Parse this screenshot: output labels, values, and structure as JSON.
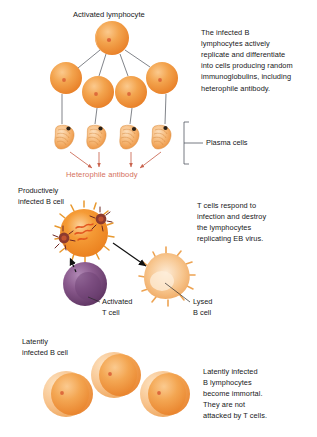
{
  "figure": {
    "background_color": "#ffffff",
    "text_color": "#17181a",
    "accent_color": "#d4705c",
    "cell_color": "#ef8b33",
    "cell_pale_color": "#f6d2a8",
    "tcell_color": "#7b4a7e",
    "virus_color": "#7a2f2a"
  },
  "labels": {
    "activated_lymphocyte": "Activated lymphocyte",
    "plasma_cells": "Plasma cells",
    "heterophile_antibody": "Heterophile antibody",
    "productively_infected_b_cell": "Productively\ninfected B cell",
    "activated_t_cell": "Activated\nT cell",
    "lysed_b_cell": "Lysed\nB cell",
    "latently_infected_b_cell": "Latently\ninfected B cell"
  },
  "paragraphs": {
    "top": "The infected B\nlymphocytes actively\nreplicate and differentiate\ninto cells producing random\nimmunoglobulins, including\nheterophile antibody.",
    "middle": "T cells respond to\ninfection and destroy\nthe lymphocytes\nreplicating EB virus.",
    "bottom": "Latently infected\nB lymphocytes\nbecome immortal.\nThey are not\nattacked by T cells."
  },
  "cells": {
    "activated_lymphocyte": {
      "cx": 112,
      "cy": 38,
      "r": 17
    },
    "daughter_lymphocytes": [
      {
        "cx": 66,
        "cy": 78,
        "r": 16
      },
      {
        "cx": 98,
        "cy": 92,
        "r": 16
      },
      {
        "cx": 131,
        "cy": 92,
        "r": 16
      },
      {
        "cx": 162,
        "cy": 78,
        "r": 16
      }
    ],
    "plasma_cells": [
      {
        "cx": 66,
        "cy": 137
      },
      {
        "cx": 98,
        "cy": 137
      },
      {
        "cx": 131,
        "cy": 137
      },
      {
        "cx": 163,
        "cy": 137
      }
    ],
    "productively_infected_b_cell": {
      "cx": 84,
      "cy": 233,
      "r": 24
    },
    "activated_t_cell": {
      "cx": 85,
      "cy": 284,
      "r": 22
    },
    "lysed_b_cell": {
      "cx": 166,
      "cy": 277,
      "r": 24
    },
    "latently_infected_b_cells": [
      {
        "cx": 66,
        "cy": 394,
        "r": 23
      },
      {
        "cx": 114,
        "cy": 375,
        "r": 23
      },
      {
        "cx": 163,
        "cy": 394,
        "r": 23
      }
    ]
  }
}
